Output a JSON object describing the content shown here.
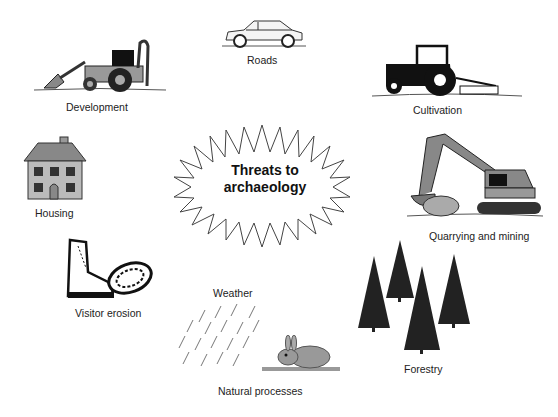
{
  "diagram": {
    "center": {
      "line1": "Threats to",
      "line2": "archaeology",
      "shape": "starburst"
    },
    "threats": [
      {
        "label": "Development",
        "icon": "backhoe-loader-icon"
      },
      {
        "label": "Roads",
        "icon": "car-icon"
      },
      {
        "label": "Cultivation",
        "icon": "tractor-plough-icon"
      },
      {
        "label": "Housing",
        "icon": "house-icon"
      },
      {
        "label": "Quarrying and mining",
        "icon": "excavator-icon"
      },
      {
        "label": "Visitor erosion",
        "icon": "hiking-boot-icon"
      },
      {
        "label": "Weather",
        "icon": "rain-icon"
      },
      {
        "label": "Natural processes",
        "icon": "rabbit-icon"
      },
      {
        "label": "Forestry",
        "icon": "conifer-trees-icon"
      }
    ]
  }
}
